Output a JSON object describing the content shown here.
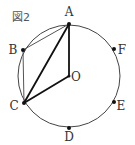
{
  "figure_label": "図2",
  "circle": {
    "cx": 69,
    "cy": 76,
    "r": 51,
    "color": "#444444"
  },
  "points": {
    "A": {
      "label": "A",
      "x": 69,
      "y": 24,
      "lx": 69,
      "ly": 16
    },
    "B": {
      "label": "B",
      "x": 23,
      "y": 50,
      "lx": 13,
      "ly": 54
    },
    "C": {
      "label": "C",
      "x": 24,
      "y": 103,
      "lx": 14,
      "ly": 110
    },
    "D": {
      "label": "D",
      "x": 69,
      "y": 128,
      "lx": 69,
      "ly": 141
    },
    "E": {
      "label": "E",
      "x": 114,
      "y": 102,
      "lx": 121,
      "ly": 110
    },
    "F": {
      "label": "F",
      "x": 114,
      "y": 49,
      "lx": 122,
      "ly": 54
    },
    "O": {
      "label": "O",
      "x": 69,
      "y": 76,
      "lx": 76,
      "ly": 81
    }
  },
  "segments": [
    {
      "from": "A",
      "to": "B",
      "weight": "thin"
    },
    {
      "from": "B",
      "to": "C",
      "weight": "thin"
    },
    {
      "from": "A",
      "to": "C",
      "weight": "thick"
    },
    {
      "from": "A",
      "to": "O",
      "weight": "thick"
    },
    {
      "from": "O",
      "to": "C",
      "weight": "thick"
    }
  ]
}
